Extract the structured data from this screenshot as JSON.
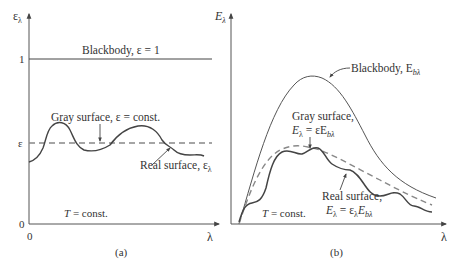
{
  "panel_a": {
    "y_axis_label": "ε",
    "y_axis_sub": "λ",
    "tick_one": "1",
    "tick_eps": "ε",
    "tick_zero_y": "0",
    "tick_zero_x": "0",
    "x_axis_label": "λ",
    "blackbody_label": "Blackbody, ε = 1",
    "gray_label": "Gray surface, ε = const.",
    "real_label": "Real surface, ε",
    "real_label_sub": "λ",
    "temp_label_T": "T",
    "temp_label_rest": " = const.",
    "caption": "(a)"
  },
  "panel_b": {
    "y_axis_label": "E",
    "y_axis_sub": "λ",
    "x_axis_label": "λ",
    "blackbody_label": "Blackbody, E",
    "blackbody_sub": "bλ",
    "gray_label_line1": "Gray surface,",
    "gray_eq_E": "E",
    "gray_eq_sub1": "λ",
    "gray_eq_mid": " = εE",
    "gray_eq_sub2": "bλ",
    "real_label_line1": "Real surface,",
    "real_eq_E": "E",
    "real_eq_sub1": "λ",
    "real_eq_mid": " = ε",
    "real_eq_sub2": "λ",
    "real_eq_E2": "E",
    "real_eq_sub3": "bλ",
    "temp_label_T": "T",
    "temp_label_rest": " = const.",
    "caption": "(b)"
  },
  "colors": {
    "axis": "#555555",
    "curve": "#444444",
    "dashed": "#888888",
    "text": "#333333"
  }
}
